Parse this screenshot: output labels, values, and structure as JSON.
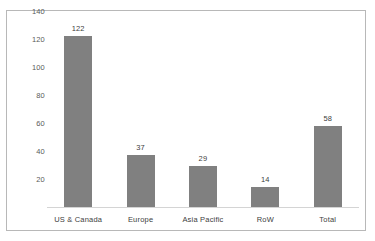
{
  "chart_data": {
    "type": "bar",
    "title": "",
    "subtitle": "",
    "xlabel": "",
    "ylabel": "",
    "categories": [
      "US & Canada",
      "Europe",
      "Asia Pacific",
      "RoW",
      "Total"
    ],
    "values": [
      122,
      37,
      29,
      14,
      58
    ],
    "data_labels": [
      "122",
      "37",
      "29",
      "14",
      "58"
    ],
    "ylim": [
      0,
      140
    ],
    "y_ticks": [
      140,
      120,
      100,
      80,
      60,
      40,
      20
    ],
    "y_tick_labels": [
      "140",
      "120",
      "100",
      "80",
      "60",
      "40",
      "20"
    ],
    "grid": false,
    "legend": false,
    "legend_position": "none",
    "series": [
      {
        "name": "",
        "values": [
          122,
          37,
          29,
          14,
          58
        ]
      }
    ],
    "colors": {
      "bar_fill": "#808080",
      "plot_border": "#b8b8b8",
      "baseline": "#d4d4d4",
      "tick_label": "#5a5a5a",
      "data_label": "#404040",
      "background": "#ffffff"
    }
  }
}
